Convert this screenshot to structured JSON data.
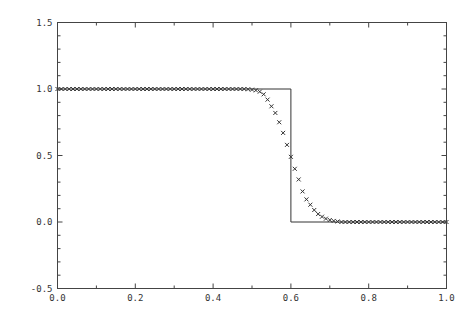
{
  "chart_data": {
    "type": "line",
    "title": "",
    "xlabel": "",
    "ylabel": "",
    "xlim": [
      0.0,
      1.0
    ],
    "ylim": [
      -0.5,
      1.5
    ],
    "grid": false,
    "legend": "none",
    "x_ticks": [
      "0.0",
      "0.2",
      "0.4",
      "0.6",
      "0.8",
      "1.0"
    ],
    "x_tick_values": [
      0.0,
      0.2,
      0.4,
      0.6,
      0.8,
      1.0
    ],
    "x_minor_step": 0.1,
    "y_ticks": [
      "-0.5",
      "0.0",
      "0.5",
      "1.0",
      "1.5"
    ],
    "y_tick_values": [
      -0.5,
      0.0,
      0.5,
      1.0,
      1.5
    ],
    "y_minor_step": 0.1,
    "series": [
      {
        "name": "exact step",
        "style": "solid-line",
        "x": [
          0.0,
          0.6,
          0.6,
          1.0
        ],
        "y": [
          1.0,
          1.0,
          0.0,
          0.0
        ]
      },
      {
        "name": "numerical",
        "style": "x-markers",
        "x_start": 0.0,
        "x_step": 0.01,
        "x_end": 1.0,
        "transition": {
          "x": [
            0.49,
            0.5,
            0.51,
            0.52,
            0.53,
            0.54,
            0.55,
            0.56,
            0.57,
            0.58,
            0.59,
            0.6,
            0.61,
            0.62,
            0.63,
            0.64,
            0.65,
            0.66,
            0.67,
            0.68,
            0.69,
            0.7,
            0.71,
            0.72
          ],
          "y": [
            0.998,
            0.995,
            0.99,
            0.98,
            0.96,
            0.92,
            0.87,
            0.82,
            0.75,
            0.67,
            0.58,
            0.49,
            0.4,
            0.32,
            0.23,
            0.17,
            0.13,
            0.09,
            0.06,
            0.04,
            0.025,
            0.015,
            0.008,
            0.004
          ]
        },
        "value_before_transition": 1.0,
        "value_after_transition": 0.0
      }
    ]
  }
}
